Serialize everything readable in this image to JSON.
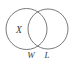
{
  "figure": {
    "kind": "venn-diagram",
    "background_color": "#ffffff",
    "stroke_color": "#6b6b6b",
    "text_color": "#3a3a3a",
    "circles": [
      {
        "name": "left-circle",
        "cx": 26.5,
        "cy": 29,
        "r": 20.5
      },
      {
        "name": "right-circle",
        "cx": 48.0,
        "cy": 29,
        "r": 20.0
      }
    ],
    "labels": {
      "inside_left": "X",
      "under_left": "W",
      "under_right": "L"
    }
  }
}
